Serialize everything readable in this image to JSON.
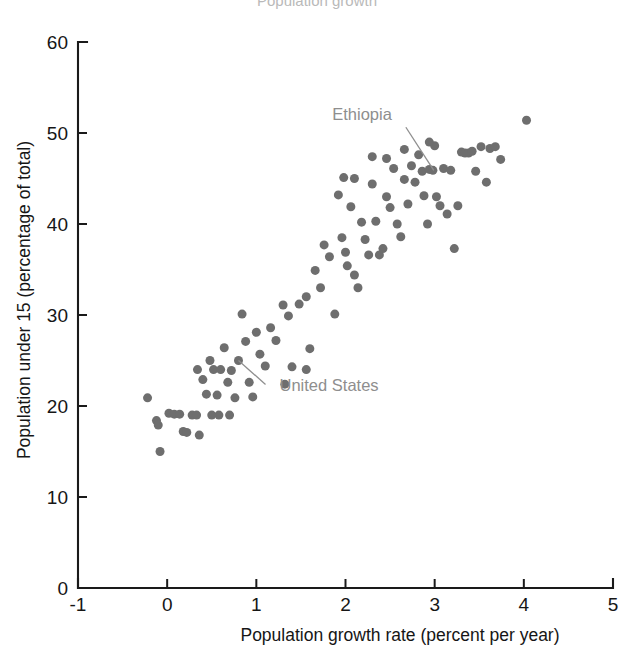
{
  "chart_data": {
    "type": "scatter",
    "title": "Population growth",
    "xlabel": "Population growth rate (percent per year)",
    "ylabel": "Population under 15 (percentage of total)",
    "xlim": [
      -1,
      5
    ],
    "ylim": [
      0,
      60
    ],
    "xticks": [
      "-1",
      "0",
      "1",
      "2",
      "3",
      "4",
      "5"
    ],
    "xtick_values": [
      -1,
      0,
      1,
      2,
      3,
      4,
      5
    ],
    "yticks": [
      "0",
      "10",
      "20",
      "30",
      "40",
      "50",
      "60"
    ],
    "ytick_values": [
      0,
      10,
      20,
      30,
      40,
      50,
      60
    ],
    "grid": false,
    "legend": null,
    "marker_color": "#6e6e6e",
    "marker_size": 9,
    "points": [
      [
        -0.22,
        20.9
      ],
      [
        -0.12,
        18.4
      ],
      [
        -0.1,
        17.9
      ],
      [
        -0.08,
        15.0
      ],
      [
        0.02,
        19.2
      ],
      [
        0.08,
        19.1
      ],
      [
        0.14,
        19.1
      ],
      [
        0.18,
        17.2
      ],
      [
        0.22,
        17.1
      ],
      [
        0.28,
        19.0
      ],
      [
        0.33,
        19.0
      ],
      [
        0.36,
        16.8
      ],
      [
        0.4,
        22.9
      ],
      [
        0.44,
        21.3
      ],
      [
        0.48,
        25.0
      ],
      [
        0.52,
        24.0
      ],
      [
        0.56,
        21.2
      ],
      [
        0.6,
        24.0
      ],
      [
        0.64,
        26.4
      ],
      [
        0.68,
        22.6
      ],
      [
        0.72,
        23.9
      ],
      [
        0.76,
        20.9
      ],
      [
        0.8,
        25.0
      ],
      [
        0.84,
        30.1
      ],
      [
        0.88,
        27.1
      ],
      [
        0.92,
        22.6
      ],
      [
        0.96,
        21.0
      ],
      [
        1.0,
        28.1
      ],
      [
        1.04,
        25.7
      ],
      [
        1.1,
        24.4
      ],
      [
        1.16,
        28.6
      ],
      [
        1.22,
        27.2
      ],
      [
        1.3,
        31.1
      ],
      [
        1.36,
        29.9
      ],
      [
        1.4,
        24.3
      ],
      [
        1.48,
        31.2
      ],
      [
        1.56,
        32.0
      ],
      [
        1.6,
        26.3
      ],
      [
        1.66,
        34.9
      ],
      [
        1.72,
        33.0
      ],
      [
        1.76,
        37.7
      ],
      [
        1.82,
        36.4
      ],
      [
        1.88,
        30.1
      ],
      [
        1.92,
        43.2
      ],
      [
        1.96,
        38.5
      ],
      [
        2.0,
        36.9
      ],
      [
        2.02,
        35.4
      ],
      [
        2.06,
        41.9
      ],
      [
        2.1,
        34.4
      ],
      [
        2.14,
        33.0
      ],
      [
        2.18,
        40.2
      ],
      [
        2.22,
        38.3
      ],
      [
        2.26,
        36.6
      ],
      [
        2.3,
        44.4
      ],
      [
        2.34,
        40.3
      ],
      [
        2.38,
        36.6
      ],
      [
        2.42,
        37.3
      ],
      [
        2.46,
        43.0
      ],
      [
        2.5,
        41.8
      ],
      [
        2.54,
        46.1
      ],
      [
        2.58,
        40.0
      ],
      [
        2.62,
        38.6
      ],
      [
        2.66,
        44.9
      ],
      [
        2.7,
        42.2
      ],
      [
        2.74,
        46.4
      ],
      [
        2.78,
        44.6
      ],
      [
        2.82,
        47.6
      ],
      [
        2.86,
        45.8
      ],
      [
        2.88,
        43.1
      ],
      [
        2.92,
        40.0
      ],
      [
        2.94,
        46.0
      ],
      [
        2.98,
        45.9
      ],
      [
        3.0,
        48.6
      ],
      [
        3.02,
        43.0
      ],
      [
        3.06,
        42.0
      ],
      [
        3.1,
        46.1
      ],
      [
        3.14,
        41.1
      ],
      [
        3.18,
        45.9
      ],
      [
        3.22,
        37.3
      ],
      [
        3.26,
        42.0
      ],
      [
        3.3,
        47.9
      ],
      [
        3.34,
        47.8
      ],
      [
        3.38,
        47.8
      ],
      [
        3.42,
        48.0
      ],
      [
        3.46,
        45.8
      ],
      [
        3.52,
        48.5
      ],
      [
        3.58,
        44.6
      ],
      [
        3.62,
        48.3
      ],
      [
        3.68,
        48.5
      ],
      [
        3.74,
        47.1
      ],
      [
        4.03,
        51.4
      ],
      [
        2.3,
        47.4
      ],
      [
        2.46,
        47.2
      ],
      [
        2.1,
        45.0
      ],
      [
        1.98,
        45.1
      ],
      [
        0.7,
        19.0
      ],
      [
        0.58,
        19.0
      ],
      [
        0.5,
        19.0
      ],
      [
        1.56,
        24.0
      ],
      [
        1.32,
        22.4
      ],
      [
        0.34,
        24.0
      ],
      [
        2.66,
        48.2
      ],
      [
        2.94,
        49.0
      ]
    ],
    "annotations": [
      {
        "label": "Ethiopia",
        "label_x": 2.52,
        "label_y": 51.4,
        "point_x": 2.99,
        "point_y": 45.9
      },
      {
        "label": "United States",
        "label_x": 1.26,
        "label_y": 21.6,
        "point_x": 0.8,
        "point_y": 25.0
      }
    ]
  }
}
